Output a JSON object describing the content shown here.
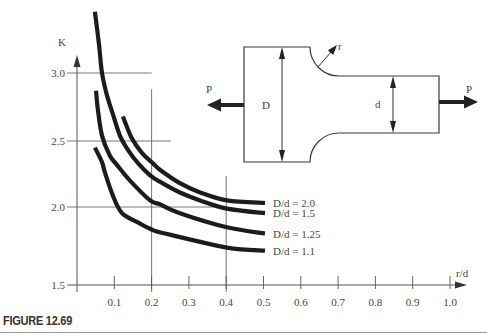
{
  "figure": {
    "caption": "FIGURE 12.69"
  },
  "chart_data": {
    "type": "line",
    "title": "",
    "xlabel": "r/d",
    "ylabel": "K",
    "xlim": [
      0,
      1.0
    ],
    "ylim": [
      1.5,
      3.45
    ],
    "x_ticks": [
      0.1,
      0.2,
      0.3,
      0.4,
      0.5,
      0.6,
      0.7,
      0.8,
      0.9,
      1.0
    ],
    "x_tick_labels": [
      "0.1",
      "0.2",
      "0.3",
      "0.4",
      "0.5",
      "0.6",
      "0.7",
      "0.8",
      "0.9",
      "1.0"
    ],
    "y_ticks": [
      1.5,
      2.0,
      2.5,
      3.0
    ],
    "y_tick_labels": [
      "1.5",
      "2.0",
      "2.5",
      "3.0"
    ],
    "grid": "partial guide lines",
    "guide_lines": [
      {
        "orientation": "horizontal",
        "value": 3.0,
        "to": 0.2
      },
      {
        "orientation": "horizontal",
        "value": 2.5,
        "to": 0.252
      },
      {
        "orientation": "horizontal",
        "value": 2.0,
        "to": 0.4
      },
      {
        "orientation": "vertical",
        "value": 0.2,
        "from": 2.88
      },
      {
        "orientation": "vertical",
        "value": 0.4,
        "from": 2.235
      }
    ],
    "legend": "inline labels at curve ends",
    "series": [
      {
        "name": "D/d = 2.0",
        "x": [
          0.123,
          0.147,
          0.174,
          0.204,
          0.223,
          0.276,
          0.33,
          0.402,
          0.504
        ],
        "y": [
          2.68,
          2.52,
          2.41,
          2.33,
          2.28,
          2.18,
          2.11,
          2.05,
          2.03
        ]
      },
      {
        "name": "D/d = 1.5",
        "x": [
          0.048,
          0.059,
          0.067,
          0.08,
          0.097,
          0.115,
          0.137,
          0.164,
          0.196,
          0.223,
          0.276,
          0.33,
          0.402,
          0.504
        ],
        "y": [
          3.45,
          3.21,
          3.0,
          2.84,
          2.69,
          2.54,
          2.43,
          2.33,
          2.24,
          2.19,
          2.11,
          2.05,
          1.99,
          1.96
        ]
      },
      {
        "name": "D/d = 1.25",
        "x": [
          0.051,
          0.056,
          0.067,
          0.088,
          0.107,
          0.142,
          0.196,
          0.223,
          0.276,
          0.402,
          0.504
        ],
        "y": [
          2.87,
          2.73,
          2.54,
          2.39,
          2.32,
          2.2,
          2.05,
          2.02,
          1.96,
          1.87,
          1.83
        ]
      },
      {
        "name": "D/d = 1.1",
        "x": [
          0.048,
          0.067,
          0.075,
          0.097,
          0.121,
          0.164,
          0.196,
          0.236,
          0.402,
          0.504
        ],
        "y": [
          2.45,
          2.34,
          2.26,
          2.08,
          1.96,
          1.9,
          1.86,
          1.83,
          1.74,
          1.72
        ]
      }
    ]
  },
  "diagram": {
    "load_left": "P",
    "load_right": "P",
    "large_width": "D",
    "small_width": "d",
    "fillet_radius": "r"
  },
  "colors": {
    "curve": "#1c1c1c",
    "axis": "#555555",
    "text": "#454545"
  }
}
